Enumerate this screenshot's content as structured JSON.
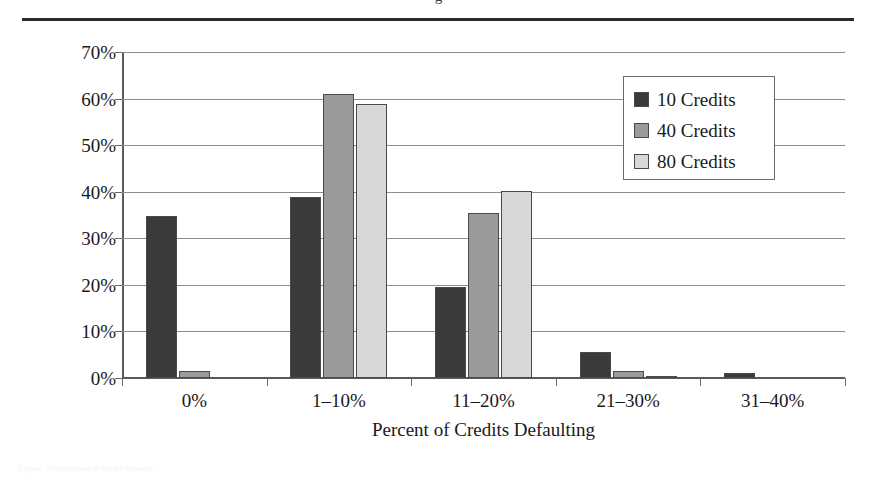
{
  "figure": {
    "clipped_title_fragment": "g",
    "bottom_caption_faint": "Figure: Distribution of credit defaults"
  },
  "chart_data": {
    "type": "bar",
    "title": "",
    "xlabel": "Percent of Credits Defaulting",
    "ylabel": "Probability",
    "categories": [
      "0%",
      "1–10%",
      "11–20%",
      "21–30%",
      "31–40%"
    ],
    "series": [
      {
        "name": "10 Credits",
        "color": "#3a3a3a",
        "values": [
          34.8,
          38.9,
          19.5,
          5.5,
          1.0
        ]
      },
      {
        "name": "40 Credits",
        "color": "#9a9a9a",
        "values": [
          1.5,
          61.0,
          35.4,
          1.5,
          0.0
        ]
      },
      {
        "name": "80 Credits",
        "color": "#d8d8d8",
        "values": [
          0.0,
          58.9,
          40.2,
          0.3,
          0.0
        ]
      }
    ],
    "ylim": [
      0,
      70
    ],
    "yticks": [
      0,
      10,
      20,
      30,
      40,
      50,
      60,
      70
    ],
    "ytick_labels": [
      "0%",
      "10%",
      "20%",
      "30%",
      "40%",
      "50%",
      "60%",
      "70%"
    ],
    "grid": true,
    "legend_position": "upper-right"
  }
}
